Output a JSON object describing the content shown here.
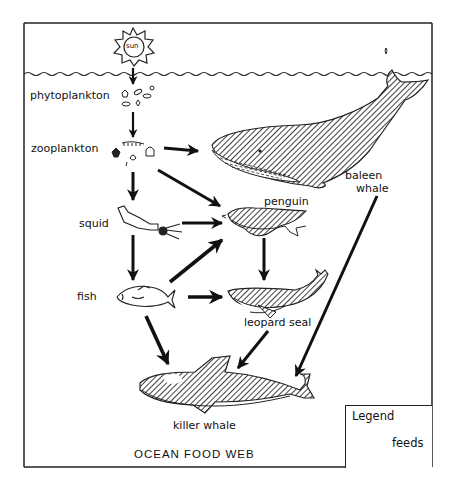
{
  "diagram": {
    "title": "OCEAN FOOD WEB",
    "sun_label": "sun",
    "organisms": [
      {
        "id": "phytoplankton",
        "label": "phytoplankton"
      },
      {
        "id": "zooplankton",
        "label": "zooplankton"
      },
      {
        "id": "baleen_whale",
        "label": "baleen whale",
        "label_line1": "baleen",
        "label_line2": "whale"
      },
      {
        "id": "squid",
        "label": "squid"
      },
      {
        "id": "penguin",
        "label": "penguin"
      },
      {
        "id": "fish",
        "label": "fish"
      },
      {
        "id": "leopard_seal",
        "label": "leopard seal"
      },
      {
        "id": "killer_whale",
        "label": "killer whale"
      }
    ],
    "edges": [
      {
        "from": "sun",
        "to": "phytoplankton"
      },
      {
        "from": "phytoplankton",
        "to": "zooplankton"
      },
      {
        "from": "zooplankton",
        "to": "baleen_whale"
      },
      {
        "from": "zooplankton",
        "to": "squid"
      },
      {
        "from": "zooplankton",
        "to": "penguin"
      },
      {
        "from": "squid",
        "to": "penguin"
      },
      {
        "from": "squid",
        "to": "fish"
      },
      {
        "from": "fish",
        "to": "penguin"
      },
      {
        "from": "fish",
        "to": "leopard_seal"
      },
      {
        "from": "fish",
        "to": "killer_whale"
      },
      {
        "from": "penguin",
        "to": "leopard_seal"
      },
      {
        "from": "leopard_seal",
        "to": "killer_whale"
      },
      {
        "from": "baleen_whale",
        "to": "killer_whale"
      }
    ],
    "legend": {
      "title": "Legend",
      "arrow_meaning": "feeds"
    }
  }
}
